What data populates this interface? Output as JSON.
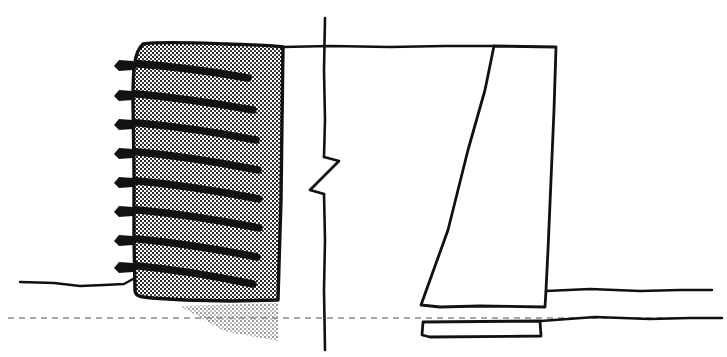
{
  "canvas": {
    "width": 727,
    "height": 357,
    "background": "#ffffff",
    "ink": "#111111",
    "hatch_dark": "#2b2b2b",
    "hatch_faded": "#8d8d8d"
  },
  "drawing": {
    "title": "Retaining wall cross-section comparison",
    "description": "Hand-drawn engineering section: soil-nailed/anchored wall at left and gravity (trapezoidal) retaining wall at right, separated by a vertical break line with a zigzag break symbol.",
    "style": "hand-drawn ink line work with stipple hatching",
    "line_weight_heavy": 3.2,
    "line_weight_medium": 2.2,
    "line_weight_light": 1.6
  },
  "grade_lines": {
    "top_grade": {
      "label": "top grade line",
      "y": 47,
      "x_start": 283,
      "x_end": 494,
      "points": "283,47 330,46 390,47 445,46 494,46"
    },
    "left_ground": {
      "label": "left ground surface line",
      "y": 283,
      "x_start": 20,
      "x_end": 133,
      "points": "20,282 54,283 80,286 104,285 124,284 133,279"
    },
    "right_ground": {
      "label": "right ground surface line",
      "y": 290,
      "x_start": 545,
      "x_end": 712,
      "points": "545,291 590,289 640,291 680,290 712,290"
    },
    "lower_right_ground": {
      "label": "lower right ground line below break",
      "y": 318,
      "x_start": 546,
      "x_end": 722,
      "points": "546,318 595,316 650,318 690,317 722,317"
    },
    "centerline": {
      "label": "dashed horizontal centerline",
      "y": 318,
      "x_start": 8,
      "x_end": 722,
      "dash": "6 5"
    }
  },
  "break_line": {
    "label": "vertical break line with zigzag break symbol",
    "x": 324,
    "y_top": 18,
    "y_bottom": 350,
    "zigzag": {
      "label": "zigzag break symbol",
      "points": "324,156 338,160 310,190 324,194"
    },
    "upper_segment": "325,18 324,70 325,120 324,158",
    "lower_segment": "324,193 325,240 324,290 325,350"
  },
  "left_wall": {
    "name": "soil-nailed anchored wall",
    "face_x_top": 133,
    "face_x_bottom": 136,
    "back_x_top": 283,
    "back_x_bottom": 278,
    "y_top": 47,
    "y_bottom": 300,
    "outline_points": "143,44 175,43 215,45 255,44 283,47 282,120 281,200 279,265 278,300 230,301 185,300 150,298 136,292 134,240 133,170 133,100 134,60",
    "hatch_fill": "stipple",
    "faded_wedge": {
      "label": "faded hatched wedge below grade",
      "points": "180,306 278,303 278,340 222,330"
    }
  },
  "anchors": {
    "label": "soil nail / anchor bars",
    "count": 8,
    "bars": [
      {
        "id": 1,
        "head_x": 120,
        "head_y": 65,
        "tip_x": 246,
        "tip_y": 77
      },
      {
        "id": 2,
        "head_x": 120,
        "head_y": 95,
        "tip_x": 252,
        "tip_y": 108
      },
      {
        "id": 3,
        "head_x": 120,
        "head_y": 124,
        "tip_x": 255,
        "tip_y": 138
      },
      {
        "id": 4,
        "head_x": 120,
        "head_y": 153,
        "tip_x": 257,
        "tip_y": 168
      },
      {
        "id": 5,
        "head_x": 120,
        "head_y": 182,
        "tip_x": 258,
        "tip_y": 197
      },
      {
        "id": 6,
        "head_x": 120,
        "head_y": 211,
        "tip_x": 258,
        "tip_y": 226
      },
      {
        "id": 7,
        "head_x": 120,
        "head_y": 240,
        "tip_x": 256,
        "tip_y": 255
      },
      {
        "id": 8,
        "head_x": 120,
        "head_y": 266,
        "tip_x": 252,
        "tip_y": 282
      }
    ]
  },
  "right_wall": {
    "name": "gravity retaining wall",
    "top_y": 46,
    "bottom_y": 307,
    "top_left_x": 494,
    "top_right_x": 556,
    "bottom_left_x": 420,
    "bottom_right_x": 545,
    "outline_points": "494,46 556,47 554,110 551,180 548,250 545,290 545,307 480,306 440,307 420,305 448,230 468,150 485,90",
    "footing": {
      "label": "footing below centerline",
      "outline_points": "423,322 540,321 541,333 525,334 430,336 422,335"
    },
    "step_right": {
      "label": "step at right of wall base",
      "points": "545,290 545,307"
    }
  },
  "annotations": {
    "left_label": "anchored soil-nail wall",
    "right_label": "gravity retaining wall",
    "break_label": "break line"
  }
}
